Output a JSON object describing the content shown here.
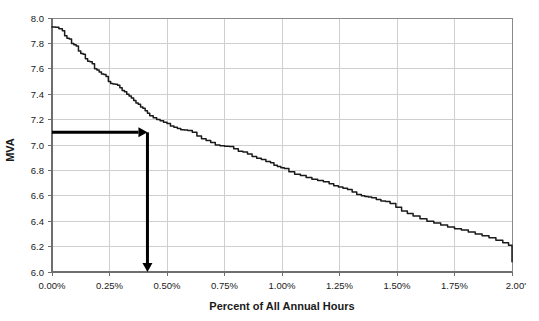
{
  "chart_data": {
    "type": "line",
    "title": "",
    "xlabel": "Percent of All Annual Hours",
    "ylabel": "MVA",
    "xlim": [
      0.0,
      2.0
    ],
    "ylim": [
      6.0,
      8.0
    ],
    "grid": true,
    "legend": null,
    "x_tick_labels": [
      "0.00%",
      "0.25%",
      "0.50%",
      "0.75%",
      "1.00%",
      "1.25%",
      "1.50%",
      "1.75%",
      "2.00'"
    ],
    "x_tick_values": [
      0.0,
      0.25,
      0.5,
      0.75,
      1.0,
      1.25,
      1.5,
      1.75,
      2.0
    ],
    "y_tick_labels": [
      "6.0",
      "6.2",
      "6.4",
      "6.6",
      "6.8",
      "7.0",
      "7.2",
      "7.4",
      "7.6",
      "7.8",
      "8.0"
    ],
    "y_tick_values": [
      6.0,
      6.2,
      6.4,
      6.6,
      6.8,
      7.0,
      7.2,
      7.4,
      7.6,
      7.8,
      8.0
    ],
    "series": [
      {
        "name": "Load Duration Curve",
        "color": "#1a1a1a",
        "x": [
          0.0,
          0.015,
          0.03,
          0.045,
          0.055,
          0.065,
          0.075,
          0.085,
          0.095,
          0.105,
          0.115,
          0.125,
          0.135,
          0.145,
          0.155,
          0.165,
          0.175,
          0.185,
          0.195,
          0.205,
          0.215,
          0.225,
          0.235,
          0.245,
          0.255,
          0.265,
          0.275,
          0.285,
          0.295,
          0.305,
          0.315,
          0.325,
          0.335,
          0.345,
          0.355,
          0.365,
          0.375,
          0.385,
          0.395,
          0.405,
          0.415,
          0.425,
          0.44,
          0.455,
          0.47,
          0.485,
          0.5,
          0.515,
          0.53,
          0.545,
          0.56,
          0.575,
          0.59,
          0.61,
          0.63,
          0.65,
          0.67,
          0.69,
          0.71,
          0.73,
          0.75,
          0.77,
          0.79,
          0.81,
          0.83,
          0.85,
          0.87,
          0.89,
          0.91,
          0.93,
          0.95,
          0.965,
          0.98,
          0.995,
          1.01,
          1.03,
          1.055,
          1.08,
          1.105,
          1.13,
          1.155,
          1.18,
          1.205,
          1.225,
          1.245,
          1.265,
          1.285,
          1.305,
          1.325,
          1.345,
          1.36,
          1.375,
          1.39,
          1.41,
          1.43,
          1.45,
          1.47,
          1.495,
          1.52,
          1.545,
          1.57,
          1.6,
          1.63,
          1.66,
          1.69,
          1.72,
          1.75,
          1.78,
          1.81,
          1.84,
          1.87,
          1.9,
          1.93,
          1.96,
          1.985,
          2.0
        ],
        "y": [
          7.93,
          7.928,
          7.915,
          7.9,
          7.86,
          7.84,
          7.835,
          7.8,
          7.79,
          7.78,
          7.74,
          7.72,
          7.715,
          7.68,
          7.66,
          7.655,
          7.64,
          7.6,
          7.59,
          7.575,
          7.56,
          7.555,
          7.54,
          7.5,
          7.485,
          7.48,
          7.478,
          7.47,
          7.45,
          7.43,
          7.42,
          7.4,
          7.385,
          7.37,
          7.35,
          7.33,
          7.32,
          7.3,
          7.29,
          7.27,
          7.25,
          7.23,
          7.215,
          7.2,
          7.19,
          7.18,
          7.17,
          7.15,
          7.14,
          7.13,
          7.12,
          7.118,
          7.115,
          7.1,
          7.07,
          7.05,
          7.035,
          7.02,
          7.0,
          6.995,
          6.99,
          6.988,
          6.97,
          6.95,
          6.945,
          6.93,
          6.91,
          6.895,
          6.885,
          6.87,
          6.86,
          6.84,
          6.83,
          6.82,
          6.815,
          6.79,
          6.77,
          6.76,
          6.745,
          6.73,
          6.72,
          6.71,
          6.695,
          6.68,
          6.67,
          6.66,
          6.65,
          6.63,
          6.61,
          6.6,
          6.595,
          6.59,
          6.585,
          6.57,
          6.56,
          6.555,
          6.54,
          6.51,
          6.48,
          6.46,
          6.44,
          6.42,
          6.4,
          6.385,
          6.37,
          6.355,
          6.34,
          6.33,
          6.315,
          6.3,
          6.285,
          6.27,
          6.25,
          6.23,
          6.21,
          6.08
        ]
      }
    ],
    "annotations": [
      {
        "name": "horizontal-reference-arrow",
        "kind": "arrow",
        "from": {
          "x": 0.0,
          "y": 7.1
        },
        "to": {
          "x": 0.415,
          "y": 7.1
        },
        "color": "#000000"
      },
      {
        "name": "vertical-reference-arrow",
        "kind": "arrow",
        "from": {
          "x": 0.415,
          "y": 7.1
        },
        "to": {
          "x": 0.415,
          "y": 6.0
        },
        "color": "#000000"
      }
    ]
  }
}
